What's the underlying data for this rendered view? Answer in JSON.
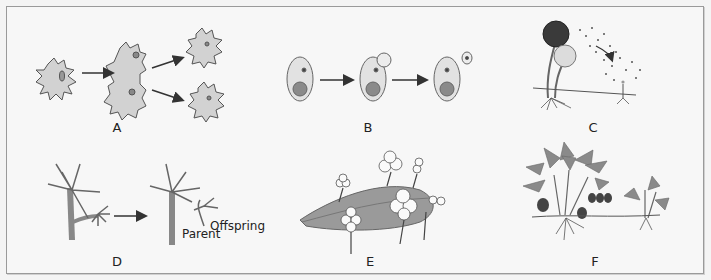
{
  "figure": {
    "panels": [
      {
        "id": "A",
        "label": "A",
        "subject": "amoeba binary fission"
      },
      {
        "id": "B",
        "label": "B",
        "subject": "yeast budding"
      },
      {
        "id": "C",
        "label": "C",
        "subject": "spore formation"
      },
      {
        "id": "D",
        "label": "D",
        "subject": "hydra budding",
        "annotations": [
          "Parent",
          "Offspring"
        ]
      },
      {
        "id": "E",
        "label": "E",
        "subject": "leaf plantlets"
      },
      {
        "id": "F",
        "label": "F",
        "subject": "runner / stolon"
      }
    ]
  },
  "colors": {
    "border": "#9a9a9a",
    "background": "#f7f7f7",
    "cell_fill": "#d6d6d6",
    "stroke": "#555555",
    "dark": "#3a3a3a",
    "leaf": "#8f8f8f"
  }
}
